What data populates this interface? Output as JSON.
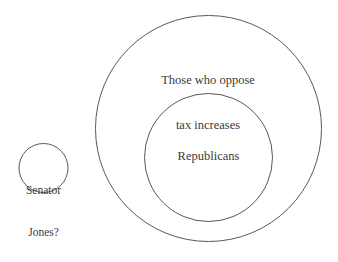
{
  "diagram": {
    "type": "euler-diagram",
    "background_color": "#ffffff",
    "stroke_color": "#58585a",
    "text_color": "#3a3a3c",
    "sets": [
      {
        "id": "oppose-tax-increases",
        "name": "Those who oppose tax increases",
        "label_line1": "Those who oppose",
        "label_line2": "tax increases",
        "shape": "circle",
        "center_x": 208.5,
        "center_y": 128.5,
        "radius": 113.5,
        "relation": "outer-set"
      },
      {
        "id": "republicans",
        "name": "Republicans",
        "label_line1": "Republicans",
        "shape": "circle",
        "center_x": 208.5,
        "center_y": 157.5,
        "radius": 64.5,
        "relation": "subset-of-oppose-tax-increases"
      },
      {
        "id": "senator-jones",
        "name": "Senator Jones?",
        "label_line1": "Senator",
        "label_line2": "Jones?",
        "shape": "circle",
        "center_x": 43.5,
        "center_y": 168,
        "radius": 25,
        "relation": "disjoint"
      }
    ]
  }
}
